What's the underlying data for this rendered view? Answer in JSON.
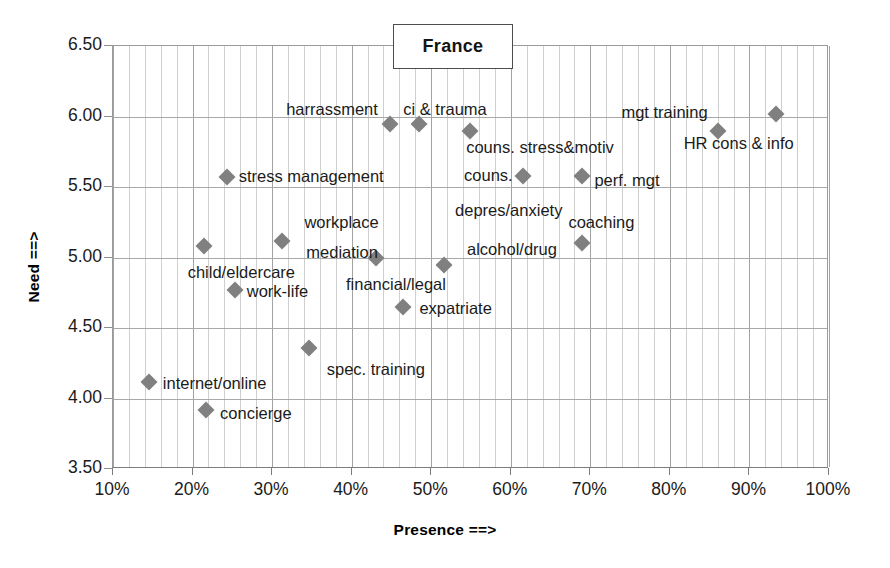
{
  "chart_data": {
    "type": "scatter",
    "title": "France",
    "xlabel": "Presence ==>",
    "ylabel": "Need ==>",
    "xlim": [
      10,
      100
    ],
    "ylim": [
      3.5,
      6.5
    ],
    "x_ticks": [
      "10%",
      "20%",
      "30%",
      "40%",
      "50%",
      "60%",
      "70%",
      "80%",
      "90%",
      "100%"
    ],
    "x_tick_values": [
      10,
      20,
      30,
      40,
      50,
      60,
      70,
      80,
      90,
      100
    ],
    "y_ticks": [
      "3.50",
      "4.00",
      "4.50",
      "5.00",
      "5.50",
      "6.00",
      "6.50"
    ],
    "y_tick_values": [
      3.5,
      4.0,
      4.5,
      5.0,
      5.5,
      6.0,
      6.5
    ],
    "x_minor_step": 2,
    "grid": "major-horizontal-and-vertical-plus-minor-vertical",
    "legend": "none",
    "marker_shape": "diamond",
    "marker_color": "#808080",
    "points": [
      {
        "label": "harrassment",
        "x": 44.8,
        "y": 5.95,
        "label_anchor": "right",
        "label_dx": -12,
        "label_dy": -14
      },
      {
        "label": "ci & trauma",
        "x": 48.5,
        "y": 5.95,
        "label_anchor": "left",
        "label_dx": -16,
        "label_dy": -14
      },
      {
        "label": "couns. stress&motiv",
        "x": 54.9,
        "y": 5.9,
        "label_anchor": "left",
        "label_dx": -4,
        "label_dy": 17
      },
      {
        "label": "mgt training",
        "x": 86.0,
        "y": 5.9,
        "label_anchor": "right",
        "label_dx": -10,
        "label_dy": -18
      },
      {
        "label": "HR cons & info",
        "x": 93.3,
        "y": 6.02,
        "label_anchor": "right",
        "label_dx": 18,
        "label_dy": 30
      },
      {
        "label": "stress management",
        "x": 24.3,
        "y": 5.57,
        "label_anchor": "left",
        "label_dx": 12,
        "label_dy": 0
      },
      {
        "label": "couns.",
        "x": 61.5,
        "y": 5.58,
        "label_anchor": "right",
        "label_dx": -10,
        "label_dy": 0
      },
      {
        "label": "perf. mgt",
        "x": 69.0,
        "y": 5.58,
        "label_anchor": "left",
        "label_dx": 12,
        "label_dy": 5
      },
      {
        "label": "depres/anxiety",
        "x": null,
        "y": null,
        "label_anchor": "left",
        "label_only": true,
        "label_x": 53.0,
        "label_y": 5.33
      },
      {
        "label": "workplace",
        "x": 31.3,
        "y": 5.12,
        "label_anchor": "left",
        "label_dx": 22,
        "label_dy": -18
      },
      {
        "label": "mediation",
        "x": null,
        "y": null,
        "label_anchor": "left",
        "label_only": true,
        "label_x": 34.3,
        "label_y": 5.03
      },
      {
        "label": "child/eldercare",
        "x": 21.4,
        "y": 5.08,
        "label_anchor": "left",
        "label_dx": -16,
        "label_dy": 27
      },
      {
        "label": "alcohol/drug",
        "x": null,
        "y": null,
        "label_anchor": "left",
        "label_only": true,
        "label_x": 54.5,
        "label_y": 5.05
      },
      {
        "label": "coaching",
        "x": 69.0,
        "y": 5.1,
        "label_anchor": "left",
        "label_dx": -14,
        "label_dy": -20
      },
      {
        "label": "financial/legal",
        "x": 51.6,
        "y": 4.95,
        "label_anchor": "right",
        "label_dx": 2,
        "label_dy": 20
      },
      {
        "label": "unlabeled-mediation",
        "x": 43.0,
        "y": 5.0,
        "label_anchor": "left",
        "hide_label": true
      },
      {
        "label": "work-life",
        "x": 25.3,
        "y": 4.77,
        "label_anchor": "left",
        "label_dx": 12,
        "label_dy": 2
      },
      {
        "label": "expatriate",
        "x": 46.5,
        "y": 4.65,
        "label_anchor": "left",
        "label_dx": 16,
        "label_dy": 2
      },
      {
        "label": "spec. training",
        "x": 34.6,
        "y": 4.36,
        "label_anchor": "left",
        "label_dx": 18,
        "label_dy": 22
      },
      {
        "label": "internet/online",
        "x": 14.5,
        "y": 4.12,
        "label_anchor": "left",
        "label_dx": 14,
        "label_dy": 2
      },
      {
        "label": "concierge",
        "x": 21.7,
        "y": 3.92,
        "label_anchor": "left",
        "label_dx": 14,
        "label_dy": 4
      }
    ]
  }
}
